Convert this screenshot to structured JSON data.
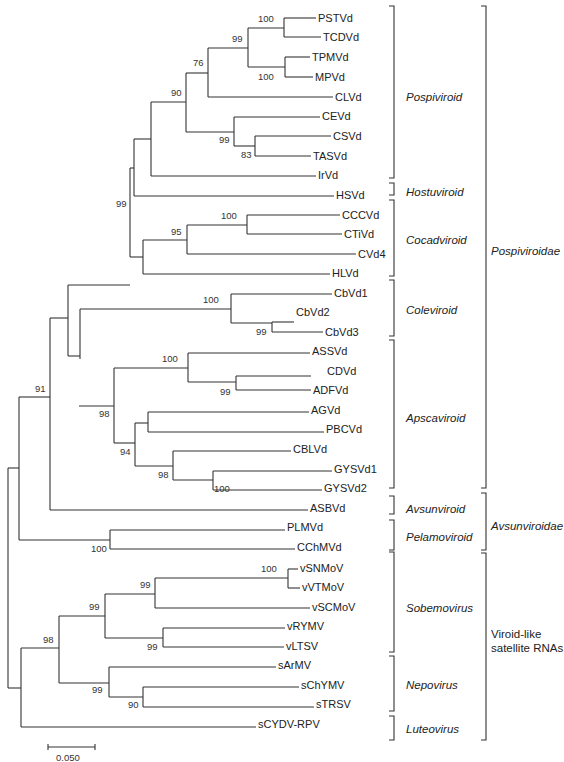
{
  "figure": {
    "type": "phylogenetic_tree",
    "scale_bar": {
      "label": "0.050",
      "x1": 48,
      "x2": 95,
      "y": 747
    }
  },
  "tips": [
    {
      "name": "PSTVd",
      "x": 318,
      "y": 18
    },
    {
      "name": "TCDVd",
      "x": 323,
      "y": 37
    },
    {
      "name": "TPMVd",
      "x": 312,
      "y": 57
    },
    {
      "name": "MPVd",
      "x": 315,
      "y": 77
    },
    {
      "name": "CLVd",
      "x": 335,
      "y": 97
    },
    {
      "name": "CEVd",
      "x": 322,
      "y": 116
    },
    {
      "name": "CSVd",
      "x": 333,
      "y": 136
    },
    {
      "name": "TASVd",
      "x": 313,
      "y": 156
    },
    {
      "name": "IrVd",
      "x": 318,
      "y": 175
    },
    {
      "name": "HSVd",
      "x": 336,
      "y": 195
    },
    {
      "name": "CCCVd",
      "x": 342,
      "y": 215
    },
    {
      "name": "CTiVd",
      "x": 344,
      "y": 234
    },
    {
      "name": "CVd4",
      "x": 358,
      "y": 254
    },
    {
      "name": "HLVd",
      "x": 332,
      "y": 273
    },
    {
      "name": "CbVd1",
      "x": 334,
      "y": 293
    },
    {
      "name": "CbVd2",
      "x": 296,
      "y": 312
    },
    {
      "name": "CbVd3",
      "x": 325,
      "y": 332
    },
    {
      "name": "ASSVd",
      "x": 312,
      "y": 351
    },
    {
      "name": "CDVd",
      "x": 327,
      "y": 371
    },
    {
      "name": "ADFVd",
      "x": 313,
      "y": 390
    },
    {
      "name": "AGVd",
      "x": 311,
      "y": 410
    },
    {
      "name": "PBCVd",
      "x": 326,
      "y": 429
    },
    {
      "name": "CBLVd",
      "x": 293,
      "y": 449
    },
    {
      "name": "GYSVd1",
      "x": 334,
      "y": 469
    },
    {
      "name": "GYSVd2",
      "x": 324,
      "y": 488
    },
    {
      "name": "ASBVd",
      "x": 310,
      "y": 508
    },
    {
      "name": "PLMVd",
      "x": 287,
      "y": 527
    },
    {
      "name": "CChMVd",
      "x": 297,
      "y": 547
    },
    {
      "name": "vSNMoV",
      "x": 300,
      "y": 568
    },
    {
      "name": "vVTMoV",
      "x": 302,
      "y": 587
    },
    {
      "name": "vSCMoV",
      "x": 312,
      "y": 607
    },
    {
      "name": "vRYMV",
      "x": 287,
      "y": 626
    },
    {
      "name": "vLTSV",
      "x": 286,
      "y": 646
    },
    {
      "name": "sArMV",
      "x": 278,
      "y": 665
    },
    {
      "name": "sChYMV",
      "x": 301,
      "y": 685
    },
    {
      "name": "sTRSV",
      "x": 316,
      "y": 704
    },
    {
      "name": "sCYDV-RPV",
      "x": 258,
      "y": 724
    }
  ],
  "branches": [
    [
      284,
      18,
      284,
      37
    ],
    [
      284,
      18,
      316,
      18
    ],
    [
      284,
      37,
      321,
      37
    ],
    [
      285,
      57,
      285,
      77
    ],
    [
      285,
      57,
      310,
      57
    ],
    [
      285,
      77,
      313,
      77
    ],
    [
      248,
      28,
      248,
      67
    ],
    [
      248,
      28,
      284,
      28
    ],
    [
      248,
      67,
      285,
      67
    ],
    [
      208,
      48,
      208,
      97
    ],
    [
      208,
      48,
      248,
      48
    ],
    [
      208,
      97,
      333,
      97
    ],
    [
      255,
      136,
      255,
      156
    ],
    [
      255,
      136,
      331,
      136
    ],
    [
      255,
      156,
      311,
      156
    ],
    [
      234,
      117,
      234,
      146
    ],
    [
      234,
      117,
      320,
      117
    ],
    [
      234,
      146,
      255,
      146
    ],
    [
      186,
      73,
      186,
      132
    ],
    [
      186,
      73,
      208,
      73
    ],
    [
      186,
      132,
      234,
      132
    ],
    [
      151,
      102,
      151,
      176
    ],
    [
      151,
      102,
      186,
      102
    ],
    [
      151,
      176,
      316,
      176
    ],
    [
      134,
      139,
      134,
      196
    ],
    [
      134,
      139,
      151,
      139
    ],
    [
      134,
      196,
      334,
      196
    ],
    [
      247,
      215,
      247,
      234
    ],
    [
      247,
      215,
      340,
      215
    ],
    [
      247,
      234,
      342,
      234
    ],
    [
      187,
      225,
      187,
      254
    ],
    [
      187,
      225,
      247,
      225
    ],
    [
      187,
      254,
      356,
      254
    ],
    [
      143,
      240,
      143,
      274
    ],
    [
      143,
      240,
      187,
      240
    ],
    [
      143,
      274,
      330,
      274
    ],
    [
      130,
      168,
      130,
      257
    ],
    [
      130,
      168,
      134,
      168
    ],
    [
      130,
      257,
      143,
      257
    ],
    [
      272,
      322,
      272,
      332
    ],
    [
      272,
      322,
      294,
      322
    ],
    [
      272,
      332,
      323,
      332
    ],
    [
      231,
      294,
      231,
      323
    ],
    [
      231,
      294,
      332,
      294
    ],
    [
      231,
      323,
      272,
      323
    ],
    [
      80,
      309,
      80,
      359
    ],
    [
      80,
      309,
      231,
      309
    ],
    [
      68,
      285,
      68,
      356
    ],
    [
      68,
      285,
      130,
      285
    ],
    [
      68,
      356,
      80,
      356
    ],
    [
      236,
      376,
      236,
      390
    ],
    [
      236,
      376,
      311,
      376
    ],
    [
      236,
      390,
      311,
      390
    ],
    [
      188,
      353,
      188,
      382
    ],
    [
      188,
      353,
      310,
      353
    ],
    [
      188,
      382,
      236,
      382
    ],
    [
      148,
      412,
      148,
      432
    ],
    [
      148,
      412,
      309,
      412
    ],
    [
      148,
      432,
      324,
      432
    ],
    [
      213,
      471,
      213,
      490
    ],
    [
      213,
      471,
      332,
      471
    ],
    [
      213,
      490,
      322,
      490
    ],
    [
      173,
      451,
      173,
      480
    ],
    [
      173,
      451,
      291,
      451
    ],
    [
      173,
      480,
      213,
      480
    ],
    [
      135,
      423,
      135,
      466
    ],
    [
      135,
      423,
      148,
      423
    ],
    [
      135,
      466,
      173,
      466
    ],
    [
      114,
      368,
      114,
      443
    ],
    [
      114,
      368,
      188,
      368
    ],
    [
      114,
      443,
      135,
      443
    ],
    [
      79,
      406,
      79,
      406
    ],
    [
      79,
      406,
      114,
      406
    ],
    [
      50,
      318,
      50,
      510
    ],
    [
      50,
      318,
      68,
      318
    ],
    [
      50,
      510,
      308,
      510
    ],
    [
      110,
      530,
      110,
      549
    ],
    [
      110,
      530,
      285,
      530
    ],
    [
      110,
      549,
      295,
      549
    ],
    [
      19,
      397,
      19,
      540
    ],
    [
      19,
      397,
      50,
      397
    ],
    [
      19,
      540,
      110,
      540
    ],
    [
      288,
      569,
      288,
      588
    ],
    [
      288,
      569,
      298,
      569
    ],
    [
      288,
      588,
      300,
      588
    ],
    [
      155,
      578,
      155,
      608
    ],
    [
      155,
      578,
      288,
      578
    ],
    [
      155,
      608,
      310,
      608
    ],
    [
      163,
      628,
      163,
      647
    ],
    [
      163,
      628,
      285,
      628
    ],
    [
      163,
      647,
      284,
      647
    ],
    [
      105,
      594,
      105,
      638
    ],
    [
      105,
      594,
      155,
      594
    ],
    [
      105,
      638,
      163,
      638
    ],
    [
      143,
      687,
      143,
      707
    ],
    [
      143,
      687,
      299,
      687
    ],
    [
      143,
      707,
      314,
      707
    ],
    [
      109,
      667,
      109,
      697
    ],
    [
      109,
      667,
      276,
      667
    ],
    [
      109,
      697,
      143,
      697
    ],
    [
      59,
      616,
      59,
      683
    ],
    [
      59,
      616,
      105,
      616
    ],
    [
      59,
      683,
      109,
      683
    ],
    [
      21,
      648,
      21,
      727
    ],
    [
      21,
      648,
      59,
      648
    ],
    [
      21,
      727,
      256,
      727
    ],
    [
      8,
      468,
      8,
      688
    ],
    [
      8,
      468,
      19,
      468
    ],
    [
      8,
      688,
      21,
      688
    ]
  ],
  "bootstrap": [
    {
      "label": "100",
      "x": 258,
      "y": 22
    },
    {
      "label": "99",
      "x": 232,
      "y": 42
    },
    {
      "label": "100",
      "x": 258,
      "y": 80
    },
    {
      "label": "76",
      "x": 193,
      "y": 66
    },
    {
      "label": "90",
      "x": 171,
      "y": 96
    },
    {
      "label": "99",
      "x": 219,
      "y": 143
    },
    {
      "label": "83",
      "x": 241,
      "y": 158
    },
    {
      "label": "99",
      "x": 116,
      "y": 207
    },
    {
      "label": "100",
      "x": 221,
      "y": 219
    },
    {
      "label": "95",
      "x": 171,
      "y": 235
    },
    {
      "label": "100",
      "x": 203,
      "y": 303
    },
    {
      "label": "99",
      "x": 256,
      "y": 335
    },
    {
      "label": "100",
      "x": 162,
      "y": 362
    },
    {
      "label": "99",
      "x": 220,
      "y": 395
    },
    {
      "label": "98",
      "x": 99,
      "y": 417
    },
    {
      "label": "94",
      "x": 120,
      "y": 455
    },
    {
      "label": "98",
      "x": 158,
      "y": 478
    },
    {
      "label": "100",
      "x": 214,
      "y": 492
    },
    {
      "label": "91",
      "x": 35,
      "y": 392
    },
    {
      "label": "100",
      "x": 91,
      "y": 552
    },
    {
      "label": "100",
      "x": 261,
      "y": 572
    },
    {
      "label": "99",
      "x": 140,
      "y": 588
    },
    {
      "label": "99",
      "x": 89,
      "y": 610
    },
    {
      "label": "99",
      "x": 147,
      "y": 650
    },
    {
      "label": "98",
      "x": 43,
      "y": 643
    },
    {
      "label": "99",
      "x": 92,
      "y": 693
    },
    {
      "label": "90",
      "x": 128,
      "y": 708
    }
  ],
  "genera": [
    {
      "name": "Pospiviroid",
      "top": 6,
      "bottom": 178,
      "label_y": 97
    },
    {
      "name": "Hostuviroid",
      "top": 183,
      "bottom": 195,
      "label_y": 192
    },
    {
      "name": "Cocadviroid",
      "top": 200,
      "bottom": 276,
      "label_y": 240
    },
    {
      "name": "Coleviroid",
      "top": 280,
      "bottom": 336,
      "label_y": 310
    },
    {
      "name": "Apscaviroid",
      "top": 340,
      "bottom": 488,
      "label_y": 418
    },
    {
      "name": "Avsunviroid",
      "top": 496,
      "bottom": 514,
      "label_y": 509
    },
    {
      "name": "Pelamoviroid",
      "top": 520,
      "bottom": 550,
      "label_y": 537
    },
    {
      "name": "Sobemovirus",
      "top": 552,
      "bottom": 652,
      "label_y": 608
    },
    {
      "name": "Nepovirus",
      "top": 656,
      "bottom": 711,
      "label_y": 685
    },
    {
      "name": "Luteovirus",
      "top": 716,
      "bottom": 740,
      "label_y": 729
    }
  ],
  "families": [
    {
      "name": "Pospiviroidae",
      "top": 6,
      "bottom": 488,
      "label_lines": [
        "Pospiviroidae"
      ],
      "label_y": 251,
      "italic": true
    },
    {
      "name": "Avsunviroidae",
      "top": 493,
      "bottom": 550,
      "label_lines": [
        "Avsunviroidae"
      ],
      "label_y": 526,
      "italic": true
    },
    {
      "name": "Viroid-like satellite RNAs",
      "top": 553,
      "bottom": 740,
      "label_lines": [
        "Viroid-like",
        "satellite RNAs"
      ],
      "label_y": 641,
      "italic": false
    }
  ]
}
